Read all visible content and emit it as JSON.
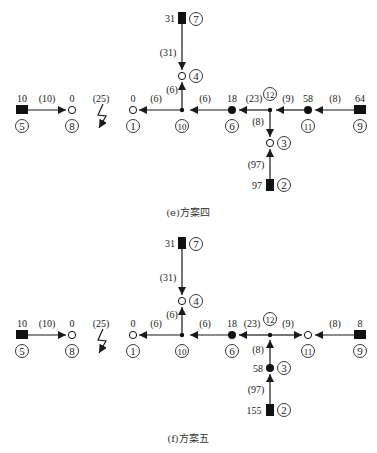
{
  "diagrams": [
    {
      "id": "e",
      "caption": "(e)方案四",
      "nodes": {
        "n1": {
          "id": "1",
          "value": "0",
          "type": "empty-circle"
        },
        "n2": {
          "id": "2",
          "value": "97",
          "type": "source-square"
        },
        "n3": {
          "id": "3",
          "value": "",
          "type": "empty-circle"
        },
        "n4": {
          "id": "4",
          "value": "",
          "type": "empty-circle"
        },
        "n5": {
          "id": "5",
          "value": "10",
          "type": "source-square"
        },
        "n6": {
          "id": "6",
          "value": "18",
          "type": "filled-circle"
        },
        "n7": {
          "id": "7",
          "value": "31",
          "type": "source-square"
        },
        "n8": {
          "id": "8",
          "value": "0",
          "type": "empty-circle"
        },
        "n9": {
          "id": "9",
          "value": "64",
          "type": "source-square"
        },
        "n10": {
          "id": "10",
          "value": "",
          "type": "junction"
        },
        "n11": {
          "id": "11",
          "value": "58",
          "type": "filled-circle"
        },
        "n12": {
          "id": "12",
          "value": "",
          "type": "junction"
        }
      },
      "edges": {
        "e5_8": "(10)",
        "e_fault": "(25)",
        "e10_1": "(6)",
        "e7_4": "(31)",
        "e10_4": "(6)",
        "e6_10": "(6)",
        "e12_6": "(23)",
        "e11_12": "(9)",
        "e9_11": "(8)",
        "e12_3": "(8)",
        "e2_3": "(97)"
      }
    },
    {
      "id": "f",
      "caption": "(f)方案五",
      "nodes": {
        "n1": {
          "id": "1",
          "value": "0",
          "type": "empty-circle"
        },
        "n2": {
          "id": "2",
          "value": "155",
          "type": "source-square"
        },
        "n3": {
          "id": "3",
          "value": "58",
          "type": "filled-circle"
        },
        "n4": {
          "id": "4",
          "value": "",
          "type": "empty-circle"
        },
        "n5": {
          "id": "5",
          "value": "10",
          "type": "source-square"
        },
        "n6": {
          "id": "6",
          "value": "18",
          "type": "filled-circle"
        },
        "n7": {
          "id": "7",
          "value": "31",
          "type": "source-square"
        },
        "n8": {
          "id": "8",
          "value": "0",
          "type": "empty-circle"
        },
        "n9": {
          "id": "9",
          "value": "8",
          "type": "source-square"
        },
        "n10": {
          "id": "10",
          "value": "",
          "type": "junction"
        },
        "n11": {
          "id": "11",
          "value": "",
          "type": "empty-circle"
        },
        "n12": {
          "id": "12",
          "value": "",
          "type": "junction"
        }
      },
      "edges": {
        "e5_8": "(10)",
        "e_fault": "(25)",
        "e10_1": "(6)",
        "e7_4": "(31)",
        "e10_4": "(6)",
        "e6_10": "(6)",
        "e12_6": "(23)",
        "e12_11": "(9)",
        "e9_11": "(8)",
        "e3_12": "(8)",
        "e2_3": "(97)"
      }
    }
  ],
  "colors": {
    "line": "#1a1a1a",
    "text": "#222222",
    "background": "#ffffff"
  }
}
